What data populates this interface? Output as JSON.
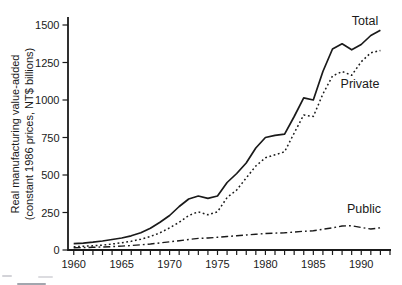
{
  "chart_data": {
    "type": "line",
    "title": "",
    "ylabel_line1": "Real manufacturing value-added",
    "ylabel_line2": "(constant 1986 prices, NT$ billions)",
    "xlabel": "",
    "xlim": [
      1959.4,
      1993
    ],
    "ylim": [
      0,
      1500
    ],
    "grid": false,
    "line_color": "#1a1a1a",
    "legend_position": "inline-labels",
    "x": [
      1960,
      1961,
      1962,
      1963,
      1964,
      1965,
      1966,
      1967,
      1968,
      1969,
      1970,
      1971,
      1972,
      1973,
      1974,
      1975,
      1976,
      1977,
      1978,
      1979,
      1980,
      1981,
      1982,
      1983,
      1984,
      1985,
      1986,
      1987,
      1988,
      1989,
      1990,
      1991,
      1992
    ],
    "series": [
      {
        "name": "Total",
        "style": "solid",
        "values": [
          42,
          46,
          52,
          60,
          70,
          80,
          95,
          115,
          145,
          185,
          230,
          290,
          340,
          360,
          345,
          360,
          450,
          510,
          580,
          680,
          750,
          765,
          772,
          890,
          1015,
          1000,
          1190,
          1340,
          1375,
          1335,
          1370,
          1430,
          1465
        ]
      },
      {
        "name": "Private",
        "style": "dotted",
        "values": [
          22,
          25,
          28,
          33,
          40,
          48,
          58,
          72,
          90,
          115,
          147,
          185,
          230,
          255,
          235,
          255,
          350,
          400,
          480,
          560,
          615,
          635,
          655,
          780,
          900,
          890,
          1040,
          1160,
          1190,
          1165,
          1255,
          1315,
          1330
        ]
      },
      {
        "name": "Public",
        "style": "dashdot",
        "values": [
          15,
          16,
          18,
          20,
          23,
          26,
          30,
          35,
          40,
          47,
          55,
          62,
          70,
          77,
          80,
          85,
          90,
          95,
          100,
          105,
          110,
          113,
          115,
          120,
          125,
          128,
          138,
          148,
          160,
          162,
          150,
          140,
          148
        ]
      }
    ],
    "y_ticks": [
      0,
      250,
      500,
      750,
      1000,
      1250,
      1500
    ],
    "x_ticks_labeled": [
      1960,
      1965,
      1970,
      1975,
      1980,
      1985,
      1990
    ],
    "x_ticks_minor_range": [
      1960,
      1993
    ]
  }
}
